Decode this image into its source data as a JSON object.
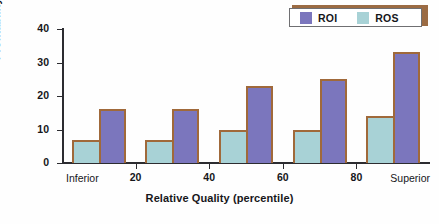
{
  "chart_data": {
    "type": "bar",
    "title": "",
    "xlabel": "Relative Quality (percentile)",
    "ylabel": "Profitability (percentage)",
    "categories": [
      "10",
      "30",
      "50",
      "70",
      "90"
    ],
    "series": [
      {
        "name": "ROS",
        "color": "#a8d2d6",
        "values": [
          7,
          7,
          10,
          10,
          14
        ]
      },
      {
        "name": "ROI",
        "color": "#7b76bd",
        "values": [
          16,
          16,
          23,
          25,
          33
        ]
      }
    ],
    "ylim": [
      0,
      40
    ],
    "yticks": [
      "0",
      "10",
      "20",
      "30",
      "40"
    ],
    "ytick_values": [
      0,
      10,
      20,
      30,
      40
    ],
    "xlim": [
      0,
      100
    ],
    "xticks": [
      "20",
      "40",
      "60",
      "80"
    ],
    "xtick_values": [
      20,
      40,
      60,
      80
    ],
    "x_axis_endpoints": {
      "left": "Inferior",
      "right": "Superior"
    },
    "grid": false,
    "legend_position": "top-right",
    "legend": [
      {
        "label": "ROI",
        "color": "#7b76bd"
      },
      {
        "label": "ROS",
        "color": "#a8d2d6"
      }
    ],
    "bar_outline_color": "#a0693a",
    "axis_color": "#2c2c30",
    "background": "#fefefe"
  }
}
